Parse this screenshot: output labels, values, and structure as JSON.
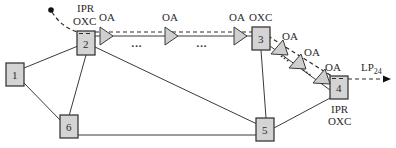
{
  "diagram": {
    "nodes": [
      {
        "id": "1",
        "label": "1",
        "x": 6,
        "y": 63
      },
      {
        "id": "2",
        "label": "2",
        "x": 77,
        "y": 31,
        "top_label_1": "IPR",
        "top_label_2": "OXC"
      },
      {
        "id": "3",
        "label": "3",
        "x": 252,
        "y": 27,
        "top_label": "OXC"
      },
      {
        "id": "4",
        "label": "4",
        "x": 330,
        "y": 78,
        "bottom_label_1": "IPR",
        "bottom_label_2": "OXC"
      },
      {
        "id": "5",
        "label": "5",
        "x": 256,
        "y": 118
      },
      {
        "id": "6",
        "label": "6",
        "x": 60,
        "y": 115
      }
    ],
    "links": [
      [
        "1",
        "2"
      ],
      [
        "1",
        "6"
      ],
      [
        "2",
        "6"
      ],
      [
        "2",
        "5"
      ],
      [
        "3",
        "5"
      ],
      [
        "6",
        "5"
      ],
      [
        "5",
        "4"
      ],
      [
        "2",
        "3"
      ],
      [
        "3",
        "4"
      ]
    ],
    "amplifier_label": "OA",
    "amplifiers": [
      {
        "label": "OA"
      },
      {
        "label": "OA"
      },
      {
        "label": "OA"
      },
      {
        "label": "OA"
      },
      {
        "label": "OA"
      },
      {
        "label": "OA"
      }
    ],
    "ellipsis": "···",
    "lightpath": {
      "label": "LP",
      "subscript": "24"
    }
  }
}
